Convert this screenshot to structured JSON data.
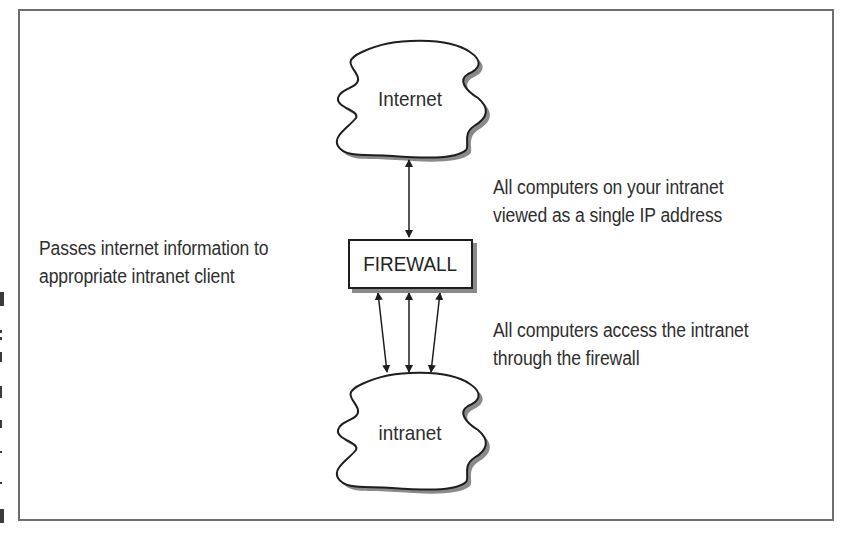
{
  "diagram": {
    "title": "",
    "nodes": {
      "internet": {
        "label": "Internet",
        "shape": "cloud"
      },
      "firewall": {
        "label": "FIREWALL",
        "shape": "box"
      },
      "intranet": {
        "label": "intranet",
        "shape": "cloud"
      }
    },
    "edges": [
      {
        "from": "internet",
        "to": "firewall",
        "style": "double-arrow",
        "count": 1
      },
      {
        "from": "firewall",
        "to": "intranet",
        "style": "double-arrow",
        "count": 3
      }
    ],
    "annotations": {
      "left_firewall": {
        "line1": "Passes internet information to",
        "line2": "appropriate intranet client"
      },
      "right_upper": {
        "line1": "All computers on your intranet",
        "line2": "viewed as a single IP address"
      },
      "right_lower": {
        "line1": "All computers access the intranet",
        "line2": "through the firewall"
      }
    },
    "colors": {
      "stroke": "#1e1e1e",
      "shadow": "#8a8a8a",
      "frame": "#6e6e6e",
      "text": "#2e2e2e",
      "background": "#ffffff"
    }
  }
}
